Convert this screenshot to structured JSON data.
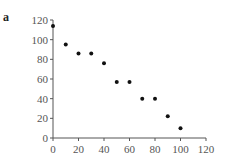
{
  "panel_label": "a",
  "chart_data": {
    "type": "scatter",
    "title": "",
    "xlabel": "",
    "ylabel": "",
    "xlim": [
      0,
      120
    ],
    "ylim": [
      0,
      120
    ],
    "x_ticks": [
      0,
      20,
      40,
      60,
      80,
      100,
      120
    ],
    "y_ticks": [
      0,
      20,
      40,
      60,
      80,
      100,
      120
    ],
    "grid": false,
    "legend": null,
    "series": [
      {
        "name": "data",
        "x": [
          0,
          10,
          20,
          30,
          40,
          50,
          60,
          70,
          80,
          90,
          100
        ],
        "y": [
          114,
          95,
          86,
          86,
          76,
          57,
          57,
          40,
          40,
          22,
          10
        ]
      }
    ],
    "marker_color": "#111111",
    "axis_color": "#555555"
  }
}
